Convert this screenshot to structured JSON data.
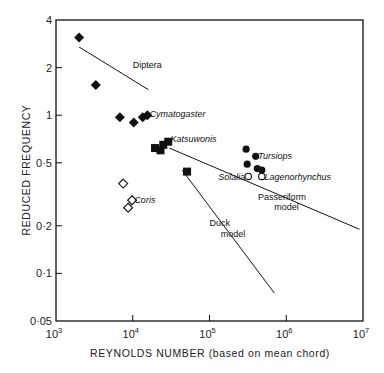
{
  "chart_data": {
    "type": "scatter",
    "title": "",
    "xlabel": "REYNOLDS NUMBER (based on mean chord)",
    "ylabel": "REDUCED FREQUENCY",
    "xscale": "log",
    "yscale": "log",
    "xlim": [
      1000,
      10000000
    ],
    "ylim": [
      0.05,
      4
    ],
    "grid": false,
    "legend": "none (inline annotations)",
    "x_ticks": [
      {
        "value": 1000,
        "base": "10",
        "exp": "3"
      },
      {
        "value": 10000,
        "base": "10",
        "exp": "4"
      },
      {
        "value": 100000,
        "base": "10",
        "exp": "5"
      },
      {
        "value": 1000000,
        "base": "10",
        "exp": "6"
      },
      {
        "value": 10000000,
        "base": "10",
        "exp": "7"
      }
    ],
    "y_ticks": [
      {
        "value": 4,
        "label": "4"
      },
      {
        "value": 2,
        "label": "2"
      },
      {
        "value": 1,
        "label": "1"
      },
      {
        "value": 0.5,
        "label": "0·5"
      },
      {
        "value": 0.2,
        "label": "0·2"
      },
      {
        "value": 0.1,
        "label": "0·1"
      },
      {
        "value": 0.05,
        "label": "0·05"
      }
    ],
    "series": [
      {
        "name": "Insects / Cymatogaster (filled diamonds)",
        "marker": "filled-diamond",
        "points": [
          {
            "x": 2000,
            "y": 3.1
          },
          {
            "x": 3300,
            "y": 1.55
          },
          {
            "x": 6800,
            "y": 0.97
          },
          {
            "x": 10300,
            "y": 0.9
          },
          {
            "x": 13500,
            "y": 0.97
          },
          {
            "x": 15500,
            "y": 1.0
          }
        ]
      },
      {
        "name": "Katsuwonis (filled squares)",
        "marker": "filled-square",
        "points": [
          {
            "x": 19500,
            "y": 0.62
          },
          {
            "x": 23000,
            "y": 0.6
          },
          {
            "x": 25000,
            "y": 0.65
          },
          {
            "x": 29000,
            "y": 0.68
          },
          {
            "x": 51000,
            "y": 0.44
          }
        ]
      },
      {
        "name": "Coris (open diamonds)",
        "marker": "open-diamond",
        "points": [
          {
            "x": 7500,
            "y": 0.37
          },
          {
            "x": 9800,
            "y": 0.29
          },
          {
            "x": 8700,
            "y": 0.26
          }
        ]
      },
      {
        "name": "Tursiops (filled circles)",
        "marker": "filled-circle",
        "points": [
          {
            "x": 300000,
            "y": 0.61
          },
          {
            "x": 400000,
            "y": 0.55
          },
          {
            "x": 310000,
            "y": 0.49
          },
          {
            "x": 420000,
            "y": 0.46
          },
          {
            "x": 480000,
            "y": 0.45
          }
        ]
      },
      {
        "name": "Solalia / Lagenorhynchus (open circles)",
        "marker": "open-circle",
        "points": [
          {
            "x": 320000,
            "y": 0.41
          },
          {
            "x": 480000,
            "y": 0.41
          }
        ]
      }
    ],
    "lines": [
      {
        "name": "Diptera",
        "from": {
          "x": 2000,
          "y": 2.7
        },
        "to": {
          "x": 16000,
          "y": 1.45
        }
      },
      {
        "name": "Passeriform model",
        "from": {
          "x": 30000,
          "y": 0.62
        },
        "to": {
          "x": 9000000,
          "y": 0.19
        }
      },
      {
        "name": "Duck model",
        "from": {
          "x": 44000,
          "y": 0.45
        },
        "to": {
          "x": 700000,
          "y": 0.075
        }
      }
    ],
    "annotations": [
      {
        "text": "Diptera",
        "style": "normal",
        "x": 10000,
        "y": 2.0
      },
      {
        "text": "Cymatogaster",
        "style": "italic",
        "x": 16500,
        "y": 0.97
      },
      {
        "text": "Katsuwonis",
        "style": "italic",
        "x": 31000,
        "y": 0.68
      },
      {
        "text": "Coris",
        "style": "italic",
        "x": 10500,
        "y": 0.28
      },
      {
        "text": "Tursiops",
        "style": "italic",
        "x": 430000,
        "y": 0.53
      },
      {
        "text": "Solalia",
        "style": "italic",
        "x": 130000,
        "y": 0.39
      },
      {
        "text": "Lagenorhynchus",
        "style": "italic",
        "x": 520000,
        "y": 0.39
      },
      {
        "text": "Passeriform",
        "style": "normal",
        "x": 430000,
        "y": 0.29
      },
      {
        "text": "model",
        "style": "normal",
        "x": 700000,
        "y": 0.25
      },
      {
        "text": "Duck",
        "style": "normal",
        "x": 100000,
        "y": 0.2
      },
      {
        "text": "model",
        "style": "normal",
        "x": 140000,
        "y": 0.17
      }
    ]
  },
  "colors": {
    "ink": "#111111",
    "background": "#ffffff"
  }
}
